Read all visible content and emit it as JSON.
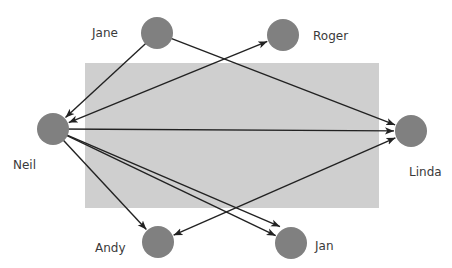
{
  "diagram": {
    "type": "directed-network",
    "background_region": {
      "x": 85,
      "y": 63,
      "width": 294,
      "height": 145,
      "color": "#cfcfcf"
    },
    "node_color": "#808080",
    "edge_color": "#222222",
    "node_radius": 16,
    "nodes": [
      {
        "id": "jane",
        "label": "Jane",
        "cx": 157,
        "cy": 33,
        "lx": 92,
        "ly": 37,
        "anchor": "start"
      },
      {
        "id": "roger",
        "label": "Roger",
        "cx": 283,
        "cy": 35,
        "lx": 313,
        "ly": 40,
        "anchor": "start"
      },
      {
        "id": "neil",
        "label": "Neil",
        "cx": 53,
        "cy": 129,
        "lx": 13,
        "ly": 169,
        "anchor": "start"
      },
      {
        "id": "linda",
        "label": "Linda",
        "cx": 411,
        "cy": 131,
        "lx": 409,
        "ly": 176,
        "anchor": "start"
      },
      {
        "id": "andy",
        "label": "Andy",
        "cx": 158,
        "cy": 242,
        "lx": 95,
        "ly": 252,
        "anchor": "start"
      },
      {
        "id": "jan",
        "label": "Jan",
        "cx": 291,
        "cy": 243,
        "lx": 315,
        "ly": 250,
        "anchor": "start"
      }
    ],
    "edges": [
      {
        "from": "jane",
        "to": "neil",
        "arrow_start": false,
        "arrow_end": true
      },
      {
        "from": "jane",
        "to": "linda",
        "arrow_start": false,
        "arrow_end": true
      },
      {
        "from": "neil",
        "to": "roger",
        "arrow_start": true,
        "arrow_end": true
      },
      {
        "from": "neil",
        "to": "linda",
        "arrow_start": false,
        "arrow_end": true
      },
      {
        "from": "neil",
        "to": "andy",
        "arrow_start": false,
        "arrow_end": true
      },
      {
        "from": "neil",
        "to": "jan",
        "arrow_start": false,
        "arrow_end": true,
        "offset": -10
      },
      {
        "from": "neil",
        "to": "jan",
        "arrow_start": false,
        "arrow_end": true,
        "offset": 0
      },
      {
        "from": "andy",
        "to": "linda",
        "arrow_start": true,
        "arrow_end": true
      }
    ]
  }
}
